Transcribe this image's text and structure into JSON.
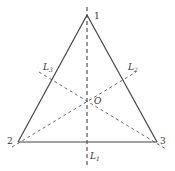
{
  "diagram": {
    "type": "equilateral-triangle-symmetry-axes",
    "colors": {
      "edge": "#444444",
      "axis": "#444444",
      "background": "#ffffff"
    },
    "vertices": [
      {
        "id": "1",
        "label": "1",
        "x": 87,
        "y": 15
      },
      {
        "id": "2",
        "label": "2",
        "x": 18,
        "y": 142
      },
      {
        "id": "3",
        "label": "3",
        "x": 157,
        "y": 142
      }
    ],
    "center": {
      "label": "O",
      "x": 87,
      "y": 100
    },
    "axes": [
      {
        "id": "L1",
        "label": "L",
        "subscript": "1",
        "through_vertex": "1"
      },
      {
        "id": "L2",
        "label": "L",
        "subscript": "2",
        "through_vertex": "2"
      },
      {
        "id": "L3",
        "label": "L",
        "subscript": "3",
        "through_vertex": "3"
      }
    ]
  }
}
